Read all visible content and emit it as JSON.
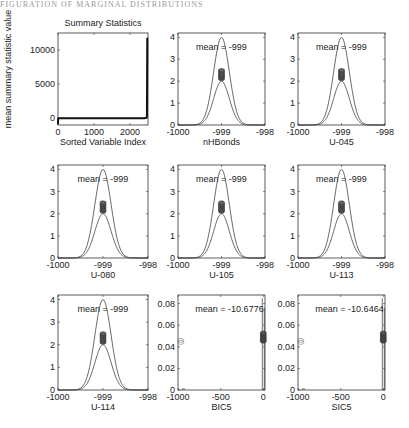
{
  "header": {
    "text": "FIGURATION OF MARGINAL DISTRIBUTIONS"
  },
  "chart_data": [
    {
      "type": "line",
      "title": "Summary Statistics",
      "xlabel": "Sorted Variable Index",
      "ylabel": "mean summary statistic value",
      "xlim": [
        0,
        2500
      ],
      "ylim": [
        -1000,
        12500
      ],
      "xticks": [
        0,
        1000,
        2000
      ],
      "yticks": [
        0,
        5000,
        10000
      ],
      "series": [
        {
          "name": "sorted means",
          "x": [
            0,
            5,
            10,
            2400,
            2450,
            2470,
            2480
          ],
          "y": [
            -900,
            -20,
            0,
            0,
            50,
            200,
            11800
          ]
        }
      ]
    },
    {
      "type": "line",
      "xlabel": "nHBonds",
      "xlim": [
        -1000,
        -998
      ],
      "ylim": [
        0,
        4.2
      ],
      "xticks": [
        -1000,
        -999,
        -998
      ],
      "yticks": [
        0,
        1,
        2,
        3,
        4
      ],
      "annotation": "mean = -999",
      "mean": -999,
      "peak_outer": 4.0,
      "peak_inner": 2.0,
      "markers_y": [
        2.1,
        2.5
      ]
    },
    {
      "type": "line",
      "xlabel": "U-045",
      "xlim": [
        -1000,
        -998
      ],
      "ylim": [
        0,
        4.2
      ],
      "xticks": [
        -1000,
        -999,
        -998
      ],
      "yticks": [
        0,
        1,
        2,
        3,
        4
      ],
      "annotation": "mean = -999",
      "mean": -999,
      "peak_outer": 4.0,
      "peak_inner": 2.0,
      "markers_y": [
        2.1,
        2.5
      ]
    },
    {
      "type": "line",
      "xlabel": "U-080",
      "xlim": [
        -1000,
        -998
      ],
      "ylim": [
        0,
        4.2
      ],
      "xticks": [
        -1000,
        -999,
        -998
      ],
      "yticks": [
        0,
        1,
        2,
        3,
        4
      ],
      "annotation": "mean = -999",
      "mean": -999,
      "peak_outer": 4.0,
      "peak_inner": 2.0,
      "markers_y": [
        2.1,
        2.5
      ]
    },
    {
      "type": "line",
      "xlabel": "U-105",
      "xlim": [
        -1000,
        -998
      ],
      "ylim": [
        0,
        4.2
      ],
      "xticks": [
        -1000,
        -999,
        -998
      ],
      "yticks": [
        0,
        1,
        2,
        3,
        4
      ],
      "annotation": "mean = -999",
      "mean": -999,
      "peak_outer": 4.0,
      "peak_inner": 2.0,
      "markers_y": [
        2.1,
        2.5
      ]
    },
    {
      "type": "line",
      "xlabel": "U-113",
      "xlim": [
        -1000,
        -998
      ],
      "ylim": [
        0,
        4.2
      ],
      "xticks": [
        -1000,
        -999,
        -998
      ],
      "yticks": [
        0,
        1,
        2,
        3,
        4
      ],
      "annotation": "mean = -999",
      "mean": -999,
      "peak_outer": 4.0,
      "peak_inner": 2.0,
      "markers_y": [
        2.1,
        2.5
      ]
    },
    {
      "type": "line",
      "xlabel": "U-114",
      "xlim": [
        -1000,
        -998
      ],
      "ylim": [
        0,
        4.2
      ],
      "xticks": [
        -1000,
        -999,
        -998
      ],
      "yticks": [
        0,
        1,
        2,
        3,
        4
      ],
      "annotation": "mean = -999",
      "mean": -999,
      "peak_outer": 4.0,
      "peak_inner": 2.0,
      "markers_y": [
        2.1,
        2.5
      ]
    },
    {
      "type": "line",
      "xlabel": "BIC5",
      "xlim": [
        -1000,
        20
      ],
      "ylim": [
        0,
        0.088
      ],
      "xticks": [
        -1000,
        -500,
        0
      ],
      "yticks": [
        0,
        0.02,
        0.04,
        0.06,
        0.08
      ],
      "annotation": "mean = -10.6776",
      "mean": -10.6776,
      "spike_x": 0,
      "spike_top": 0.085,
      "markers_y": [
        0.045,
        0.053
      ],
      "outlier": {
        "x": -990,
        "y": 0.046
      }
    },
    {
      "type": "line",
      "xlabel": "SIC5",
      "xlim": [
        -1000,
        20
      ],
      "ylim": [
        0,
        0.088
      ],
      "xticks": [
        -1000,
        -500,
        0
      ],
      "yticks": [
        0,
        0.02,
        0.04,
        0.06,
        0.08
      ],
      "annotation": "mean = -10.6464",
      "mean": -10.6464,
      "spike_x": 0,
      "spike_top": 0.085,
      "markers_y": [
        0.045,
        0.053
      ],
      "outlier": {
        "x": -990,
        "y": 0.046
      }
    }
  ]
}
